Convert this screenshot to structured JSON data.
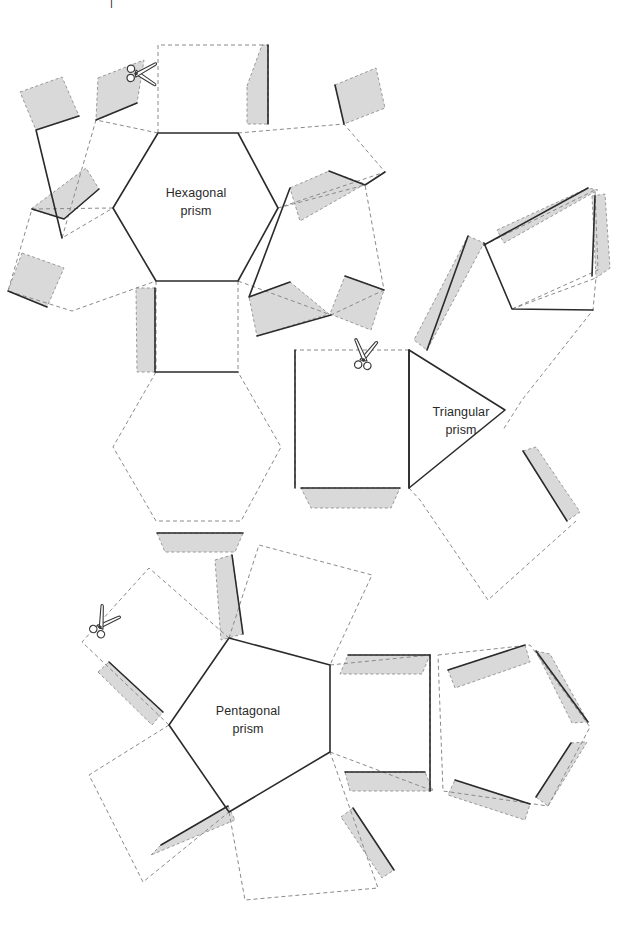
{
  "page": {
    "background_color": "#ffffff",
    "width": 629,
    "height": 930
  },
  "style": {
    "cut_line_color": "#2b2b2b",
    "fold_line_color": "#8a8a8a",
    "flap_fill_color": "#d9d9d9",
    "flap_edge_color": "#9a9a9a",
    "label_color": "#2a2a2a",
    "cut_line_width": 1.6,
    "fold_line_width": 1.0,
    "fold_dash": "4 3"
  },
  "top_fragment": {
    "text": "|",
    "note": "clipped text fragment at very top edge"
  },
  "nets": [
    {
      "id": "hexagonal-prism",
      "label_line1": "Hexagonal",
      "label_line2": "prism",
      "label_x": 196,
      "label_y": 201,
      "base_shape": "hexagon",
      "side_face_count": 6,
      "base_face_count": 2
    },
    {
      "id": "triangular-prism",
      "label_line1": "Triangular",
      "label_line2": "prism",
      "label_x": 461,
      "label_y": 420,
      "base_shape": "triangle",
      "side_face_count": 3,
      "base_face_count": 2
    },
    {
      "id": "pentagonal-prism",
      "label_line1": "Pentagonal",
      "label_line2": "prism",
      "label_x": 248,
      "label_y": 719,
      "base_shape": "pentagon",
      "side_face_count": 5,
      "base_face_count": 2
    }
  ],
  "scissors": [
    {
      "id": "scissors-hexagonal",
      "x": 146,
      "y": 72,
      "rotation": 92,
      "icon": "scissors-icon"
    },
    {
      "id": "scissors-triangular",
      "x": 363,
      "y": 350,
      "rotation": 8,
      "icon": "scissors-icon"
    },
    {
      "id": "scissors-pentagonal",
      "x": 104,
      "y": 618,
      "rotation": 34,
      "icon": "scissors-icon"
    }
  ],
  "legend": {
    "solid_line_meaning": "cut line",
    "dashed_line_meaning": "fold line",
    "gray_area_meaning": "glue flap"
  }
}
